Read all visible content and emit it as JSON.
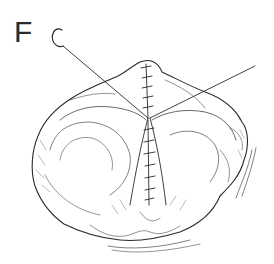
{
  "figure": {
    "panel_label": "F",
    "elements": [
      "curved-needle",
      "suture-threads",
      "tissue-mass",
      "running-suture-line"
    ],
    "colors": {
      "ink": "#2a2a2a",
      "background": "#ffffff"
    }
  }
}
